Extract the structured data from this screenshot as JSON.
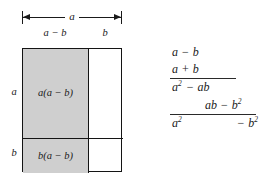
{
  "figure": {
    "caption": "",
    "colors": {
      "shaded_region": "#cfcfcf",
      "stroke": "#141414",
      "background": "#ffffff",
      "text": "#1a1a1a"
    }
  },
  "diagram": {
    "width_dimension": {
      "label": "a",
      "name": "total-width-a"
    },
    "segment_labels": {
      "top_left": "a − b",
      "top_right": "b"
    },
    "side_labels": {
      "upper": "a",
      "lower": "b"
    },
    "cells": [
      {
        "name": "cell-top-left",
        "label": "a(a − b)",
        "shaded": true
      },
      {
        "name": "cell-top-right",
        "label": "",
        "shaded": false
      },
      {
        "name": "cell-bottom-left",
        "label": "b(a − b)",
        "shaded": true
      },
      {
        "name": "cell-bottom-right",
        "label": "",
        "shaded": false
      }
    ]
  },
  "multiplication": {
    "multiplicand": {
      "term_one": "a",
      "operator": "−",
      "term_two": "b"
    },
    "multiplier": {
      "term_one": "a",
      "operator": "+",
      "term_two": "b"
    },
    "partial_one": {
      "base": "a",
      "exponent": "2",
      "operator": "−",
      "term": "ab"
    },
    "partial_two": {
      "term": "ab",
      "operator": "−",
      "base": "b",
      "exponent": "2"
    },
    "result": {
      "left_base": "a",
      "left_exponent": "2",
      "right_operator": "−",
      "right_base": "b",
      "right_exponent": "2"
    }
  }
}
